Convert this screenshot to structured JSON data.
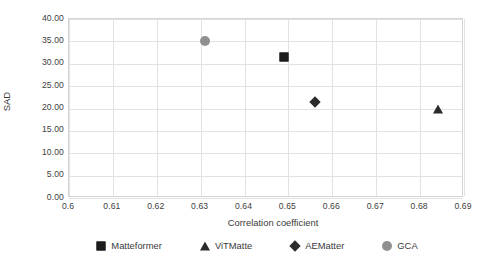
{
  "chart_data": {
    "type": "scatter",
    "title": "",
    "xlabel": "Correlation coefficient",
    "ylabel": "SAD",
    "xlim": [
      0.6,
      0.69
    ],
    "ylim": [
      0.0,
      40.0
    ],
    "xticks": [
      "0.6",
      "0.61",
      "0.62",
      "0.63",
      "0.64",
      "0.65",
      "0.66",
      "0.67",
      "0.68",
      "0.69"
    ],
    "yticks": [
      "0.00",
      "5.00",
      "10.00",
      "15.00",
      "20.00",
      "25.00",
      "30.00",
      "35.00",
      "40.00"
    ],
    "grid": true,
    "legend_position": "bottom",
    "series": [
      {
        "name": "Matteformer",
        "marker": "square",
        "color": "#1c1c1c",
        "points": [
          {
            "x": 0.649,
            "y": 31.5
          }
        ]
      },
      {
        "name": "ViTMatte",
        "marker": "triangle",
        "color": "#2b2b2b",
        "points": [
          {
            "x": 0.684,
            "y": 20.0
          }
        ]
      },
      {
        "name": "AEMatter",
        "marker": "diamond",
        "color": "#2b2b2b",
        "points": [
          {
            "x": 0.656,
            "y": 21.5
          }
        ]
      },
      {
        "name": "GCA",
        "marker": "circle",
        "color": "#909090",
        "points": [
          {
            "x": 0.631,
            "y": 35.0
          }
        ]
      }
    ]
  },
  "axes": {
    "x_title": "Correlation coefficient",
    "y_title": "SAD"
  },
  "legend": {
    "items": [
      {
        "label": "Matteformer",
        "marker": "square"
      },
      {
        "label": "ViTMatte",
        "marker": "triangle"
      },
      {
        "label": "AEMatter",
        "marker": "diamond"
      },
      {
        "label": "GCA",
        "marker": "circle"
      }
    ]
  },
  "colors": {
    "grid": "#e2e2e2",
    "frame": "#d4d4d4",
    "text": "#3a3a3a",
    "dark_marker": "#1c1c1c",
    "gray_marker": "#909090",
    "background": "#ffffff"
  }
}
